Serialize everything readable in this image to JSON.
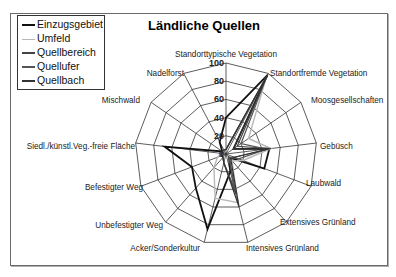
{
  "chart_data": {
    "type": "radar",
    "title": "Ländliche Quellen",
    "categories": [
      "Standorttypische Vegetation",
      "Standortfremde Vegetation",
      "Moosgesellschaften",
      "Gebüsch",
      "Laubwald",
      "Extensives Grünland",
      "Intensives Grünland",
      "Acker/Sonderkultur",
      "Unbefestigter Weg",
      "Befestigter Weg",
      "Siedl./künstl.Veg.-freie Fläche",
      "Mischwald",
      "Nadelforst"
    ],
    "ticks": [
      "0",
      "20",
      "40",
      "60",
      "80",
      "100"
    ],
    "rlim": [
      0,
      100
    ],
    "series": [
      {
        "name": "Einzugsgebiet",
        "color": "#111111",
        "width": 1.8,
        "values": [
          40,
          98,
          10,
          48,
          45,
          5,
          20,
          85,
          50,
          40,
          68,
          5,
          15
        ]
      },
      {
        "name": "Umfeld",
        "color": "#b8b8b8",
        "width": 1.4,
        "values": [
          5,
          95,
          30,
          50,
          20,
          10,
          55,
          50,
          20,
          10,
          5,
          5,
          5
        ]
      },
      {
        "name": "Quellbereich",
        "color": "#444444",
        "width": 1.2,
        "values": [
          5,
          96,
          15,
          50,
          10,
          5,
          45,
          10,
          5,
          5,
          5,
          5,
          5
        ]
      },
      {
        "name": "Quellufer",
        "color": "#555555",
        "width": 1.2,
        "values": [
          5,
          97,
          20,
          45,
          15,
          5,
          40,
          10,
          5,
          5,
          5,
          5,
          5
        ]
      },
      {
        "name": "Quellbach",
        "color": "#333333",
        "width": 1.2,
        "values": [
          5,
          99,
          10,
          48,
          10,
          8,
          60,
          10,
          5,
          5,
          5,
          5,
          5
        ]
      }
    ],
    "legend_position": "top-left",
    "grid": true
  },
  "legend": {
    "items": [
      {
        "label": "Einzugsgebiet",
        "color": "#111111"
      },
      {
        "label": "Umfeld",
        "color": "#b8b8b8"
      },
      {
        "label": "Quellbereich",
        "color": "#444444"
      },
      {
        "label": "Quellufer",
        "color": "#555555"
      },
      {
        "label": "Quellbach",
        "color": "#333333"
      }
    ]
  }
}
